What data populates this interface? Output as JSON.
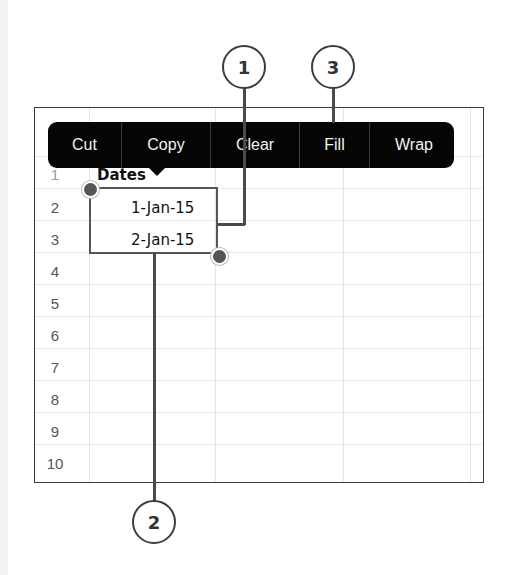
{
  "context_menu": {
    "items": [
      {
        "label": "Cut",
        "width": 73
      },
      {
        "label": "Copy",
        "width": 88
      },
      {
        "label": "Clear",
        "width": 88
      },
      {
        "label": "Fill",
        "width": 69
      },
      {
        "label": "Wrap",
        "width": 88
      }
    ]
  },
  "sheet": {
    "rows": [
      "1",
      "2",
      "3",
      "4",
      "5",
      "6",
      "7",
      "8",
      "9",
      "10"
    ],
    "cells": {
      "a1": "Dates",
      "a2": "1-Jan-15",
      "a3": "2-Jan-15"
    }
  },
  "callouts": {
    "c1": "1",
    "c2": "2",
    "c3": "3"
  },
  "colors": {
    "menu_bg": "#050505",
    "selection": "#555555",
    "callout_line": "#4a4a4a"
  }
}
